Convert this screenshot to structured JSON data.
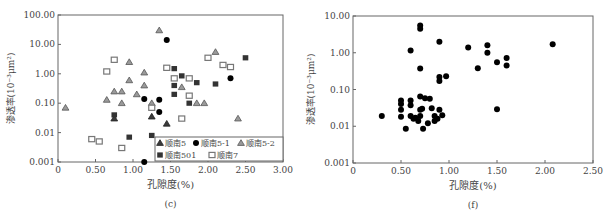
{
  "chart_data": [
    {
      "type": "scatter",
      "panel_label": "(c)",
      "xlabel": "孔隙度(%)",
      "ylabel": "渗透率(10⁻³μm²)",
      "xscale": "linear",
      "yscale": "log",
      "xlim": [
        0,
        3.0
      ],
      "ylim": [
        0.001,
        100
      ],
      "xticks": [
        "0",
        "0.50",
        "1.00",
        "1.50",
        "2.00",
        "2.50",
        "3.00"
      ],
      "yticks": [
        "0.001",
        "0.01",
        "0.10",
        "1.00",
        "10.00",
        "100.00"
      ],
      "grid": false,
      "legend_position": "lower right (inside)",
      "series": [
        {
          "name": "顺南5",
          "marker": "triangle-filled-dark",
          "color": "#444444",
          "points": [
            [
              0.75,
              0.03
            ],
            [
              1.25,
              0.035
            ],
            [
              1.45,
              0.02
            ]
          ]
        },
        {
          "name": "顺南5-1",
          "marker": "circle-filled",
          "color": "#000000",
          "points": [
            [
              1.15,
              0.14
            ],
            [
              1.35,
              0.13
            ],
            [
              1.35,
              0.05
            ],
            [
              1.45,
              14
            ],
            [
              2.3,
              0.7
            ],
            [
              1.15,
              0.001
            ]
          ]
        },
        {
          "name": "顺南5-2",
          "marker": "triangle-filled-gray",
          "color": "#999999",
          "points": [
            [
              0.1,
              0.07
            ],
            [
              0.65,
              0.13
            ],
            [
              0.75,
              0.25
            ],
            [
              0.85,
              0.25
            ],
            [
              0.85,
              0.1
            ],
            [
              0.95,
              2.5
            ],
            [
              0.95,
              0.6
            ],
            [
              1.05,
              0.2
            ],
            [
              1.15,
              1.1
            ],
            [
              1.15,
              0.4
            ],
            [
              1.25,
              0.1
            ],
            [
              1.35,
              30
            ],
            [
              1.65,
              0.35
            ],
            [
              1.85,
              0.1
            ],
            [
              1.95,
              0.1
            ],
            [
              2.1,
              5.5
            ],
            [
              2.4,
              0.03
            ]
          ]
        },
        {
          "name": "顺南501",
          "marker": "square-filled",
          "color": "#333333",
          "points": [
            [
              0.75,
              0.04
            ],
            [
              0.95,
              0.007
            ],
            [
              1.25,
              0.008
            ],
            [
              1.55,
              1.5
            ],
            [
              1.55,
              0.4
            ],
            [
              1.55,
              0.2
            ],
            [
              1.65,
              0.85
            ],
            [
              1.75,
              0.1
            ],
            [
              1.85,
              0.5
            ],
            [
              2.1,
              0.45
            ],
            [
              2.5,
              3.5
            ]
          ]
        },
        {
          "name": "顺南7",
          "marker": "square-hollow",
          "color": "#888888",
          "points": [
            [
              0.45,
              0.006
            ],
            [
              0.55,
              0.005
            ],
            [
              0.65,
              1.2
            ],
            [
              0.75,
              3.0
            ],
            [
              0.85,
              0.003
            ],
            [
              1.25,
              0.07
            ],
            [
              1.45,
              1.6
            ],
            [
              1.55,
              0.7
            ],
            [
              1.65,
              0.03
            ],
            [
              1.75,
              0.7
            ],
            [
              1.75,
              0.18
            ],
            [
              2.0,
              3.5
            ],
            [
              2.2,
              2.0
            ],
            [
              2.3,
              1.7
            ]
          ]
        }
      ]
    },
    {
      "type": "scatter",
      "panel_label": "(f)",
      "xlabel": "孔隙度(%)",
      "ylabel": "渗透率(10⁻³μm²)",
      "xscale": "linear",
      "yscale": "log",
      "xlim": [
        0,
        2.5
      ],
      "ylim": [
        0.001,
        10
      ],
      "xticks": [
        "0",
        "0.50",
        "1.00",
        "1.50",
        "2.00",
        "2.50"
      ],
      "yticks": [
        "0.001",
        "0.01",
        "0.10",
        "1.00",
        "10.00"
      ],
      "grid": false,
      "series": [
        {
          "name": "samples",
          "marker": "circle-filled",
          "color": "#000000",
          "points": [
            [
              0.3,
              0.019
            ],
            [
              0.5,
              0.05
            ],
            [
              0.5,
              0.04
            ],
            [
              0.5,
              0.028
            ],
            [
              0.5,
              0.018
            ],
            [
              0.55,
              0.0085
            ],
            [
              0.6,
              1.15
            ],
            [
              0.6,
              0.05
            ],
            [
              0.6,
              0.037
            ],
            [
              0.6,
              0.019
            ],
            [
              0.63,
              0.016
            ],
            [
              0.65,
              0.017
            ],
            [
              0.68,
              0.014
            ],
            [
              0.7,
              5.5
            ],
            [
              0.7,
              4.5
            ],
            [
              0.7,
              0.37
            ],
            [
              0.7,
              0.065
            ],
            [
              0.7,
              0.028
            ],
            [
              0.7,
              0.019
            ],
            [
              0.72,
              0.03
            ],
            [
              0.73,
              0.0085
            ],
            [
              0.75,
              0.058
            ],
            [
              0.78,
              0.012
            ],
            [
              0.8,
              0.056
            ],
            [
              0.82,
              0.031
            ],
            [
              0.85,
              0.019
            ],
            [
              0.85,
              0.014
            ],
            [
              0.88,
              0.016
            ],
            [
              0.9,
              2.0
            ],
            [
              0.9,
              0.22
            ],
            [
              0.9,
              0.17
            ],
            [
              0.9,
              0.028
            ],
            [
              0.93,
              0.02
            ],
            [
              0.97,
              0.23
            ],
            [
              1.2,
              1.4
            ],
            [
              1.3,
              0.38
            ],
            [
              1.4,
              1.6
            ],
            [
              1.4,
              1.0
            ],
            [
              1.5,
              0.55
            ],
            [
              1.5,
              0.029
            ],
            [
              1.6,
              0.72
            ],
            [
              1.6,
              0.45
            ],
            [
              2.08,
              1.7
            ]
          ]
        }
      ]
    }
  ],
  "legend": {
    "items": [
      {
        "label": "顺南5",
        "marker": "triangle-filled-dark"
      },
      {
        "label": "顺南5-1",
        "marker": "circle-filled"
      },
      {
        "label": "顺南5-2",
        "marker": "triangle-filled-gray"
      },
      {
        "label": "顺南501",
        "marker": "square-filled"
      },
      {
        "label": "顺南7",
        "marker": "square-hollow"
      }
    ]
  }
}
